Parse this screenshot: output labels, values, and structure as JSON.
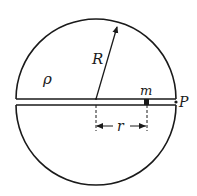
{
  "diagram": {
    "type": "physics-figure",
    "colors": {
      "stroke": "#1a1a1a",
      "background": "#ffffff"
    },
    "sphere": {
      "center": [
        96,
        102
      ],
      "radius": 80
    },
    "tunnel": {
      "upper_y": 99,
      "lower_y": 105,
      "x_start": 16,
      "x_end": 176
    },
    "labels": {
      "density": "ρ",
      "radius": "R",
      "mass": "m",
      "point": "P",
      "distance": "r"
    }
  }
}
